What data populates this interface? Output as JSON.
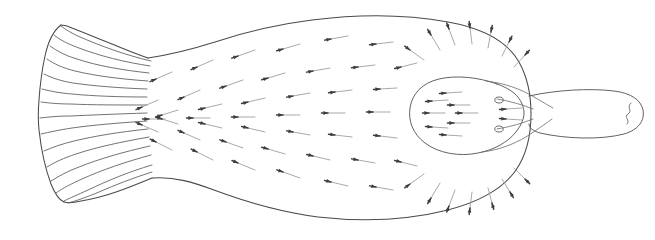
{
  "figure": {
    "title": "Flatfish dorsal view with surface flow vector field",
    "subject": "flatfish",
    "view": "dorsal",
    "background_color": "#ffffff",
    "line_color": "#4a4a4a",
    "arrow_color": "#3c3c3c",
    "arrow_tail_color": "#c8c8c8",
    "caption": "",
    "labels": []
  },
  "chart_data": {
    "type": "scatter",
    "subtitle": "",
    "xlabel": "",
    "ylabel": "",
    "xlim": [
      0,
      655
    ],
    "ylim": [
      0,
      239
    ],
    "grid": false,
    "legend": "none",
    "annotations": [],
    "vectors": [
      {
        "x": 348,
        "y": 36,
        "dx": -17,
        "dy": 3
      },
      {
        "x": 393,
        "y": 42,
        "dx": -17,
        "dy": 2
      },
      {
        "x": 300,
        "y": 44,
        "dx": -17,
        "dy": 5
      },
      {
        "x": 255,
        "y": 50,
        "dx": -17,
        "dy": 6
      },
      {
        "x": 213,
        "y": 60,
        "dx": -16,
        "dy": 7
      },
      {
        "x": 172,
        "y": 72,
        "dx": -16,
        "dy": 7
      },
      {
        "x": 330,
        "y": 68,
        "dx": -17,
        "dy": 3
      },
      {
        "x": 375,
        "y": 65,
        "dx": -17,
        "dy": 2
      },
      {
        "x": 417,
        "y": 63,
        "dx": -16,
        "dy": 4
      },
      {
        "x": 285,
        "y": 73,
        "dx": -17,
        "dy": 5
      },
      {
        "x": 243,
        "y": 80,
        "dx": -17,
        "dy": 6
      },
      {
        "x": 200,
        "y": 90,
        "dx": -16,
        "dy": 7
      },
      {
        "x": 158,
        "y": 100,
        "dx": -16,
        "dy": 7
      },
      {
        "x": 352,
        "y": 90,
        "dx": -17,
        "dy": 2
      },
      {
        "x": 397,
        "y": 88,
        "dx": -17,
        "dy": 1
      },
      {
        "x": 310,
        "y": 93,
        "dx": -17,
        "dy": 3
      },
      {
        "x": 265,
        "y": 98,
        "dx": -17,
        "dy": 4
      },
      {
        "x": 222,
        "y": 104,
        "dx": -17,
        "dy": 4
      },
      {
        "x": 178,
        "y": 110,
        "dx": -16,
        "dy": 5
      },
      {
        "x": 345,
        "y": 113,
        "dx": -17,
        "dy": 0
      },
      {
        "x": 390,
        "y": 112,
        "dx": -17,
        "dy": 0
      },
      {
        "x": 300,
        "y": 115,
        "dx": -17,
        "dy": 0
      },
      {
        "x": 255,
        "y": 117,
        "dx": -17,
        "dy": 0
      },
      {
        "x": 210,
        "y": 118,
        "dx": -17,
        "dy": 0
      },
      {
        "x": 165,
        "y": 119,
        "dx": -16,
        "dy": 0
      },
      {
        "x": 352,
        "y": 137,
        "dx": -17,
        "dy": -2
      },
      {
        "x": 397,
        "y": 138,
        "dx": -17,
        "dy": -2
      },
      {
        "x": 310,
        "y": 135,
        "dx": -17,
        "dy": -3
      },
      {
        "x": 265,
        "y": 132,
        "dx": -17,
        "dy": -4
      },
      {
        "x": 222,
        "y": 128,
        "dx": -17,
        "dy": -4
      },
      {
        "x": 178,
        "y": 124,
        "dx": -16,
        "dy": -5
      },
      {
        "x": 330,
        "y": 160,
        "dx": -17,
        "dy": -4
      },
      {
        "x": 375,
        "y": 163,
        "dx": -17,
        "dy": -3
      },
      {
        "x": 417,
        "y": 166,
        "dx": -16,
        "dy": -4
      },
      {
        "x": 285,
        "y": 154,
        "dx": -17,
        "dy": -5
      },
      {
        "x": 243,
        "y": 148,
        "dx": -17,
        "dy": -6
      },
      {
        "x": 200,
        "y": 140,
        "dx": -16,
        "dy": -7
      },
      {
        "x": 158,
        "y": 132,
        "dx": -16,
        "dy": -7
      },
      {
        "x": 348,
        "y": 186,
        "dx": -17,
        "dy": -4
      },
      {
        "x": 393,
        "y": 190,
        "dx": -17,
        "dy": -3
      },
      {
        "x": 300,
        "y": 178,
        "dx": -17,
        "dy": -6
      },
      {
        "x": 255,
        "y": 170,
        "dx": -17,
        "dy": -7
      },
      {
        "x": 213,
        "y": 160,
        "dx": -16,
        "dy": -8
      },
      {
        "x": 172,
        "y": 150,
        "dx": -16,
        "dy": -8
      },
      {
        "x": 440,
        "y": 50,
        "dx": -9,
        "dy": -15
      },
      {
        "x": 455,
        "y": 45,
        "dx": -6,
        "dy": -16
      },
      {
        "x": 472,
        "y": 44,
        "dx": -2,
        "dy": -16
      },
      {
        "x": 488,
        "y": 48,
        "dx": 3,
        "dy": -16
      },
      {
        "x": 502,
        "y": 56,
        "dx": 7,
        "dy": -14
      },
      {
        "x": 514,
        "y": 67,
        "dx": 11,
        "dy": -12
      },
      {
        "x": 424,
        "y": 60,
        "dx": -14,
        "dy": -10
      },
      {
        "x": 440,
        "y": 183,
        "dx": -9,
        "dy": 15
      },
      {
        "x": 455,
        "y": 190,
        "dx": -6,
        "dy": 16
      },
      {
        "x": 472,
        "y": 192,
        "dx": -2,
        "dy": 16
      },
      {
        "x": 488,
        "y": 188,
        "dx": 4,
        "dy": 15
      },
      {
        "x": 502,
        "y": 179,
        "dx": 8,
        "dy": 13
      },
      {
        "x": 514,
        "y": 168,
        "dx": 11,
        "dy": 11
      },
      {
        "x": 424,
        "y": 174,
        "dx": -14,
        "dy": 10
      },
      {
        "x": 462,
        "y": 92,
        "dx": -16,
        "dy": 1
      },
      {
        "x": 470,
        "y": 105,
        "dx": -16,
        "dy": 0
      },
      {
        "x": 478,
        "y": 113,
        "dx": -16,
        "dy": 0
      },
      {
        "x": 470,
        "y": 123,
        "dx": -16,
        "dy": 0
      },
      {
        "x": 462,
        "y": 136,
        "dx": -16,
        "dy": -1
      },
      {
        "x": 448,
        "y": 100,
        "dx": -16,
        "dy": 1
      },
      {
        "x": 445,
        "y": 113,
        "dx": -16,
        "dy": 0
      },
      {
        "x": 448,
        "y": 128,
        "dx": -16,
        "dy": -1
      },
      {
        "x": 522,
        "y": 108,
        "dx": -16,
        "dy": 1
      },
      {
        "x": 522,
        "y": 120,
        "dx": -16,
        "dy": -1
      }
    ]
  },
  "anatomy": {
    "parts": [
      {
        "name": "caudal-fin",
        "label": "Caudal fin"
      },
      {
        "name": "caudal-peduncle",
        "label": "Caudal peduncle"
      },
      {
        "name": "body-disc",
        "label": "Body disc"
      },
      {
        "name": "head",
        "label": "Head"
      },
      {
        "name": "snout",
        "label": "Snout"
      },
      {
        "name": "eye-upper",
        "label": "Upper eye"
      },
      {
        "name": "eye-lower",
        "label": "Lower eye"
      },
      {
        "name": "mouth",
        "label": "Mouth"
      }
    ]
  }
}
